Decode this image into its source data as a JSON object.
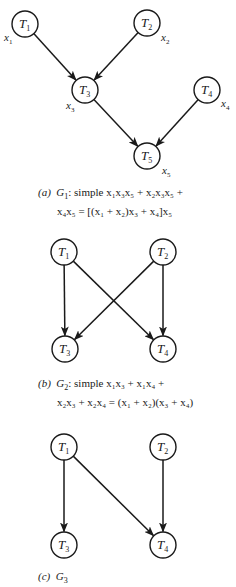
{
  "figures": [
    {
      "id": "a",
      "nodes": [
        {
          "name": "T1",
          "label": "T",
          "sub": "1",
          "cx": 25,
          "cy": 24,
          "var": "x",
          "var_sub": "1",
          "vx": 4,
          "vy": 41
        },
        {
          "name": "T2",
          "label": "T",
          "sub": "2",
          "cx": 147,
          "cy": 23,
          "var": "x",
          "var_sub": "2",
          "vx": 161,
          "vy": 41
        },
        {
          "name": "T3",
          "label": "T",
          "sub": "3",
          "cx": 85,
          "cy": 90,
          "var": "x",
          "var_sub": "3",
          "vx": 66,
          "vy": 109
        },
        {
          "name": "T4",
          "label": "T",
          "sub": "4",
          "cx": 207,
          "cy": 90,
          "var": "x",
          "var_sub": "4",
          "vx": 221,
          "vy": 107
        },
        {
          "name": "T5",
          "label": "T",
          "sub": "5",
          "cx": 147,
          "cy": 156,
          "var": "x",
          "var_sub": "5",
          "vx": 162,
          "vy": 174
        }
      ],
      "edges": [
        [
          "T1",
          "T3"
        ],
        [
          "T2",
          "T3"
        ],
        [
          "T3",
          "T5"
        ],
        [
          "T4",
          "T5"
        ]
      ],
      "caption": {
        "tag": "(a)",
        "graph": "G",
        "graph_sub": "1",
        "line1": ": simple x₁x₃x₅ + x₂x₃x₅ +",
        "line2": "x₄x₅ = [(x₁ + x₂)x₃ + x₄]x₅"
      }
    },
    {
      "id": "b",
      "nodes": [
        {
          "name": "T1",
          "label": "T",
          "sub": "1",
          "cx": 64,
          "cy": 252
        },
        {
          "name": "T2",
          "label": "T",
          "sub": "2",
          "cx": 163,
          "cy": 252
        },
        {
          "name": "T3",
          "label": "T",
          "sub": "3",
          "cx": 65,
          "cy": 349
        },
        {
          "name": "T4",
          "label": "T",
          "sub": "4",
          "cx": 163,
          "cy": 349
        }
      ],
      "edges": [
        [
          "T1",
          "T3"
        ],
        [
          "T1",
          "T4"
        ],
        [
          "T2",
          "T3"
        ],
        [
          "T2",
          "T4"
        ]
      ],
      "caption": {
        "tag": "(b)",
        "graph": "G",
        "graph_sub": "2",
        "line1": ": simple x₁x₃ + x₁x₄ +",
        "line2": "x₂x₃ + x₂x₄ = (x₁ + x₂)(x₃ + x₄)"
      }
    },
    {
      "id": "c",
      "nodes": [
        {
          "name": "T1",
          "label": "T",
          "sub": "1",
          "cx": 64,
          "cy": 447
        },
        {
          "name": "T2",
          "label": "T",
          "sub": "2",
          "cx": 163,
          "cy": 447
        },
        {
          "name": "T3",
          "label": "T",
          "sub": "3",
          "cx": 64,
          "cy": 545
        },
        {
          "name": "T4",
          "label": "T",
          "sub": "4",
          "cx": 163,
          "cy": 545
        }
      ],
      "edges": [
        [
          "T1",
          "T3"
        ],
        [
          "T1",
          "T4"
        ],
        [
          "T2",
          "T4"
        ]
      ],
      "caption": {
        "tag": "(c)",
        "graph": "G",
        "graph_sub": "3",
        "line1": "",
        "line2": ""
      }
    }
  ],
  "style": {
    "ink": "#1a1a1a",
    "background": "#ffffff",
    "node_radius": 13
  }
}
